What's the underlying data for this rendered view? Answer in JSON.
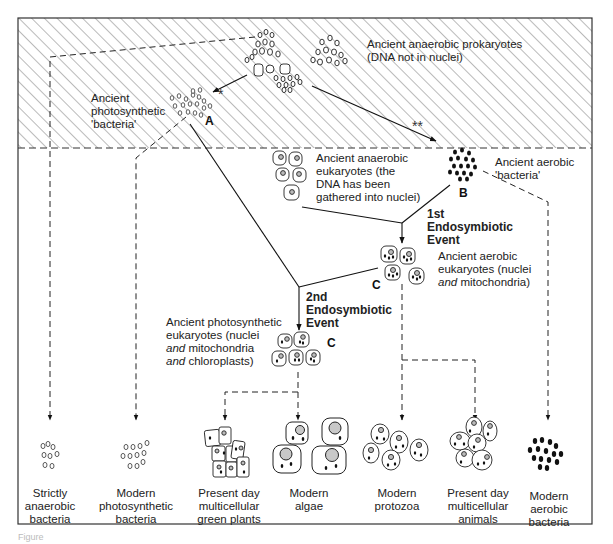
{
  "figure": {
    "caption": "Figure",
    "hatched_region": "early anaerobic atmosphere (hatched band)"
  },
  "top_region": {
    "prokaryotes_label_line1": "Ancient anaerobic prokaryotes",
    "prokaryotes_label_line2": "(DNA not in nuclei)",
    "photosynthetic_label_line1": "Ancient",
    "photosynthetic_label_line2": "photosynthetic",
    "photosynthetic_label_line3": "'bacteria'",
    "marker_single_star": "*",
    "marker_double_star": "**",
    "letter_a": "A"
  },
  "middle_region": {
    "anaerobic_eukaryotes_line1": "Ancient anaerobic",
    "anaerobic_eukaryotes_line2": "eukaryotes (the",
    "anaerobic_eukaryotes_line3": "DNA has been",
    "anaerobic_eukaryotes_line4": "gathered into nuclei)",
    "aerobic_bacteria_line1": "Ancient aerobic",
    "aerobic_bacteria_line2": "'bacteria'",
    "letter_b": "B",
    "event1_line1": "1st",
    "event1_line2": "Endosymbiotic",
    "event1_line3": "Event",
    "aerobic_eukaryotes_line1": "Ancient aerobic",
    "aerobic_eukaryotes_line2": "eukaryotes (nuclei",
    "aerobic_eukaryotes_line3_italic": "and",
    "aerobic_eukaryotes_line3_rest": " mitochondria)",
    "letter_c1": "C",
    "event2_line1": "2nd",
    "event2_line2": "Endosymbiotic",
    "event2_line3": "Event",
    "photo_eukaryotes_line1": "Ancient photosynthetic",
    "photo_eukaryotes_line2": "eukaryotes (nuclei",
    "photo_eukaryotes_line3_italic": "and",
    "photo_eukaryotes_line3_rest": " mitochondria",
    "photo_eukaryotes_line4_italic": "and",
    "photo_eukaryotes_line4_rest": " chloroplasts)",
    "letter_c2": "C"
  },
  "modern_groups": [
    {
      "line1": "Strictly",
      "line2": "anaerobic",
      "line3": "bacteria"
    },
    {
      "line1": "Modern",
      "line2": "photosynthetic",
      "line3": "bacteria"
    },
    {
      "line1": "Present day",
      "line2": "multicellular",
      "line3": "green plants"
    },
    {
      "line1": "Modern",
      "line2": "algae",
      "line3": ""
    },
    {
      "line1": "Modern",
      "line2": "protozoa",
      "line3": ""
    },
    {
      "line1": "Present day",
      "line2": "multicellular",
      "line3": "animals"
    },
    {
      "line1": "Modern",
      "line2": "aerobic",
      "line3": "bacteria"
    }
  ],
  "colors": {
    "ink": "#1a1a1a",
    "hatch": "#555555",
    "nucleus_fill": "#bdbdbd",
    "background": "#ffffff"
  }
}
